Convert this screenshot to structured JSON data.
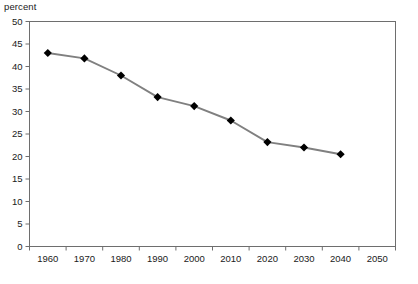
{
  "chart_data": {
    "type": "line",
    "title": "",
    "subtitle": "",
    "xlabel": "",
    "ylabel": "percent",
    "unit_label": "percent",
    "x": [
      1960,
      1970,
      1980,
      1990,
      2000,
      2010,
      2020,
      2030,
      2040
    ],
    "categories": [
      "1960",
      "1970",
      "1980",
      "1990",
      "2000",
      "2010",
      "2020",
      "2030",
      "2040"
    ],
    "values": [
      43.0,
      41.8,
      38.0,
      33.2,
      31.2,
      28.0,
      23.2,
      22.0,
      20.5
    ],
    "series": [
      {
        "name": "percent",
        "values": [
          43.0,
          41.8,
          38.0,
          33.2,
          31.2,
          28.0,
          23.2,
          22.0,
          20.5
        ],
        "line_color": "#808080",
        "marker": "diamond",
        "marker_color": "#000000"
      }
    ],
    "xlim": [
      1955,
      2055
    ],
    "ylim": [
      0,
      50
    ],
    "ytick_values": [
      0,
      5,
      10,
      15,
      20,
      25,
      30,
      35,
      40,
      45,
      50
    ],
    "ytick_labels": [
      "0",
      "5",
      "10",
      "15",
      "20",
      "25",
      "30",
      "35",
      "40",
      "45",
      "50"
    ],
    "xtick_labels": [
      "1960",
      "1970",
      "1980",
      "1990",
      "2000",
      "2010",
      "2020",
      "2030",
      "2040",
      "2050"
    ],
    "xtick_values": [
      1960,
      1970,
      1980,
      1990,
      2000,
      2010,
      2020,
      2030,
      2040,
      2050
    ],
    "grid": false,
    "legend": false,
    "legend_position": "none",
    "plot_border": true,
    "annotations": []
  },
  "colors": {
    "line": "#808080",
    "marker": "#000000",
    "axis": "#6e6e6e",
    "text": "#1a1a1a",
    "background": "#ffffff"
  },
  "footer": {
    "source_note": ""
  }
}
